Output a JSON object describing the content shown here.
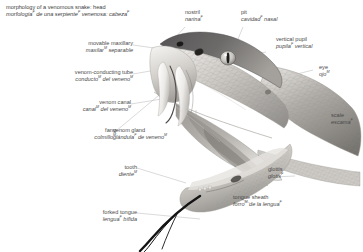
{
  "title": {
    "en": "morphology of a venomous snake: head",
    "es": "morfología",
    "es_sup1": "F",
    "es_rest": " de una serpiente",
    "es_sup2": "F",
    "es_rest2": " venenosa: cabeza",
    "es_sup3": "F",
    "es_full": "morfología F de una serpiente F venenosa: cabeza F"
  },
  "illustration": {
    "name": "venomous-snake-head-illustration",
    "subject": "venomous snake head, mouth open, in profile facing left",
    "style": "grayscale photographic illustration",
    "colors": {
      "scale_light": "#e8e6e2",
      "scale_mid": "#b9b6b1",
      "scale_dark": "#6f6d6a",
      "head_top_dark": "#4a484a",
      "mouth_interior": "#8c8a88",
      "fang_white": "#f4f3f1",
      "tongue_black": "#111111",
      "outline": "#9a9896"
    }
  },
  "labels": [
    {
      "id": "movable-maxillary",
      "en": "movable maxillary",
      "es_pre": "maxilar",
      "es_sup": "M",
      "es_post": " separable",
      "align": "right"
    },
    {
      "id": "venom-conducting-tube",
      "en": "venom-conducting tube",
      "es_pre": "conducto",
      "es_sup": "M",
      "es_post": " del veneno",
      "es_sup2": "M",
      "align": "right"
    },
    {
      "id": "venom-canal",
      "en": "venom canal",
      "es_pre": "canal",
      "es_sup": "M",
      "es_post": " del veneno",
      "es_sup2": "M",
      "align": "right"
    },
    {
      "id": "fang",
      "en": "fang",
      "es_pre": "colmillo",
      "es_sup": "M",
      "es_post": "",
      "align": "right"
    },
    {
      "id": "venom-gland",
      "en": "venom gland",
      "es_pre": "glándula",
      "es_sup": "F",
      "es_post": " de veneno",
      "es_sup2": "M",
      "align": "left"
    },
    {
      "id": "tooth",
      "en": "tooth",
      "es_pre": "diente",
      "es_sup": "M",
      "es_post": "",
      "align": "right"
    },
    {
      "id": "forked-tongue",
      "en": "forked tongue",
      "es_pre": "lengua",
      "es_sup": "F",
      "es_post": " bífida",
      "align": "right"
    },
    {
      "id": "nostril",
      "en": "nostril",
      "es_pre": "narina",
      "es_sup": "F",
      "es_post": "",
      "align": "left"
    },
    {
      "id": "pit",
      "en": "pit",
      "es_pre": "cavidad",
      "es_sup": "F",
      "es_post": " nasal",
      "align": "left"
    },
    {
      "id": "vertical-pupil",
      "en": "vertical pupil",
      "es_pre": "pupila",
      "es_sup": "F",
      "es_post": " vertical",
      "align": "left"
    },
    {
      "id": "eye",
      "en": "eye",
      "es_pre": "ojo",
      "es_sup": "M",
      "es_post": "",
      "align": "left"
    },
    {
      "id": "scale",
      "en": "scale",
      "es_pre": "escama",
      "es_sup": "F",
      "es_post": "",
      "align": "left"
    },
    {
      "id": "glottis",
      "en": "glottis",
      "es_pre": "glotis",
      "es_sup": "F",
      "es_post": "",
      "align": "left"
    },
    {
      "id": "tongue-sheath",
      "en": "tongue sheath",
      "es_pre": "forro",
      "es_sup": "M",
      "es_post": " de la lengua",
      "es_sup2": "F",
      "align": "left"
    }
  ]
}
